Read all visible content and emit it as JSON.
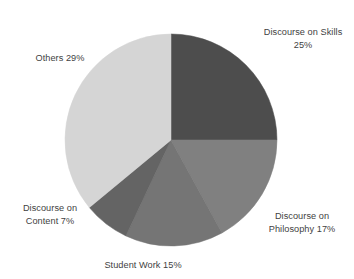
{
  "chart_data": {
    "type": "pie",
    "title": "",
    "subtitle": "",
    "xlabel": "",
    "ylabel": "",
    "grid": false,
    "legend": "none",
    "labels_position": "outside",
    "start_angle_deg": 0,
    "direction": "clockwise",
    "categories": [
      "Discourse on Skills",
      "Discourse on Philosophy",
      "Student Work",
      "Discourse on Content",
      "Others"
    ],
    "values": [
      25,
      17,
      15,
      7,
      29
    ],
    "value_unit": "%",
    "colors": [
      "#4d4d4d",
      "#808080",
      "#757575",
      "#646464",
      "#d5d5d5"
    ],
    "slices": [
      {
        "name": "Discourse on Skills",
        "value": 25,
        "label": "Discourse on Skills\n25%",
        "color": "#4d4d4d",
        "start_deg": 0,
        "end_deg": 90
      },
      {
        "name": "Discourse on Philosophy",
        "value": 17,
        "label": "Discourse on\nPhilosophy 17%",
        "color": "#808080",
        "start_deg": 90,
        "end_deg": 151.2
      },
      {
        "name": "Student Work",
        "value": 15,
        "label": "Student Work 15%",
        "color": "#757575",
        "start_deg": 151.2,
        "end_deg": 205.2
      },
      {
        "name": "Discourse on Content",
        "value": 7,
        "label": "Discourse on\nContent 7%",
        "color": "#646464",
        "start_deg": 205.2,
        "end_deg": 230.4
      },
      {
        "name": "Others",
        "value": 29,
        "label": "Others 29%",
        "color": "#d5d5d5",
        "start_deg": 230.4,
        "end_deg": 360
      }
    ],
    "geometry": {
      "center_x": 171,
      "center_y": 140,
      "radius": 106
    },
    "label_text_color": "#3f3f3f",
    "background_color": "#ffffff"
  }
}
